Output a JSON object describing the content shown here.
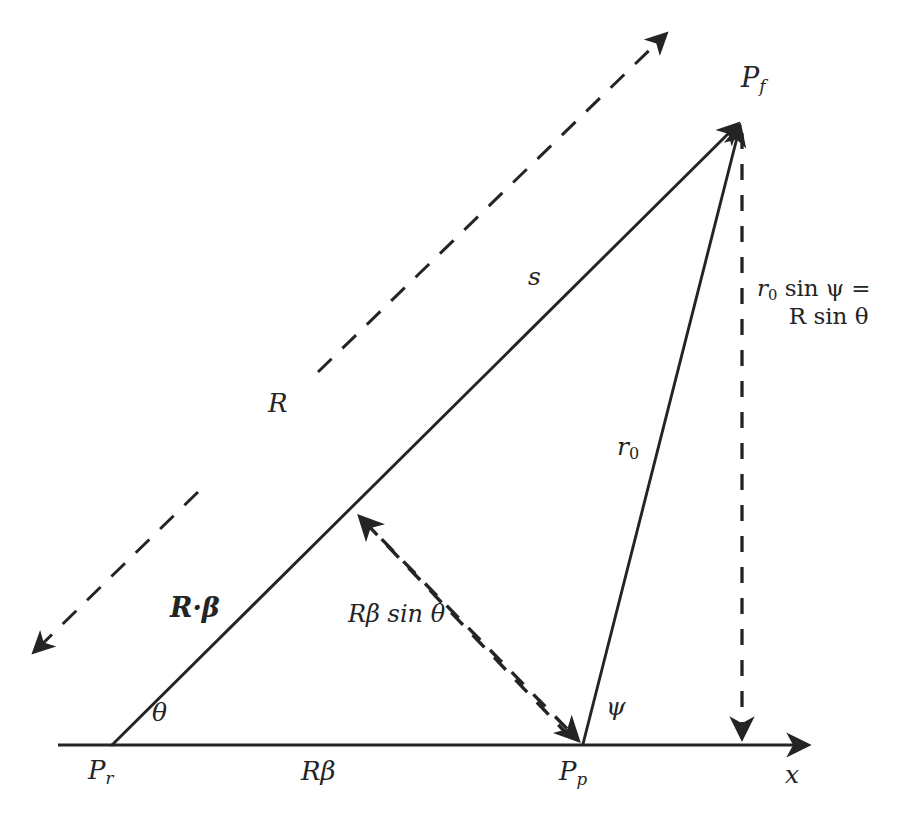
{
  "figure": {
    "kind": "geometry-vector-diagram",
    "background_color": "#ffffff",
    "ink_color": "#242424"
  },
  "labels": {
    "point_final": "P",
    "point_final_sub": "f",
    "point_retarded": "P",
    "point_retarded_sub": "r",
    "point_present": "P",
    "point_present_sub": "p",
    "axis_x": "x",
    "segment_s": "s",
    "segment_r0": "r",
    "segment_r0_sub": "0",
    "vector_R": "R",
    "vector_R_beta": "R·β",
    "arc_theta": "θ",
    "arc_psi": "ψ",
    "base_R_beta": "Rβ",
    "perp_R_beta_sin_theta": "Rβ sin θ",
    "height_line1": "r",
    "height_line1_sub": "0",
    "height_line1_rest": " sin ψ =",
    "height_line2": "R sin θ"
  },
  "geometry": {
    "P_r": [
      112,
      745
    ],
    "P_p": [
      583,
      746
    ],
    "P_f": [
      742,
      118
    ],
    "axis_start": [
      58,
      745
    ],
    "axis_end": [
      815,
      745
    ],
    "R_dashed_start": [
      28,
      657
    ],
    "R_dashed_end": [
      672,
      28
    ],
    "R_gap_from": [
      196,
      492
    ],
    "R_gap_to": [
      318,
      372
    ],
    "perp_foot": [
      355,
      512
    ],
    "vertical_drop_top": [
      742,
      133
    ],
    "vertical_drop_bottom": [
      742,
      745
    ]
  }
}
